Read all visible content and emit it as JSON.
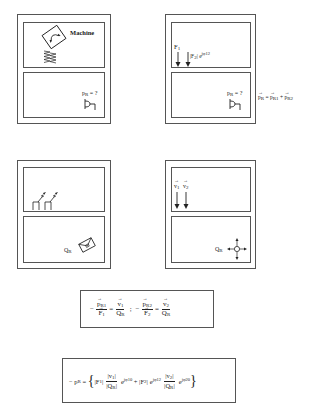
{
  "panels": [
    {
      "id": "machine",
      "top_label": "Machine",
      "bottom_label": "p",
      "bottom_label_sub": "R",
      "bottom_label_suffix": " = ?"
    },
    {
      "id": "forces",
      "force1_label": "F",
      "force1_sub": "1",
      "force2_label": "|F",
      "force2_sub": "2",
      "force2_suffix": "| e",
      "force2_exp": "jφ12",
      "bottom_label": "p",
      "bottom_label_sub": "R",
      "bottom_label_suffix": " = ?"
    },
    {
      "id": "velocity-source",
      "bottom_label": "Q",
      "bottom_label_sub": "R"
    },
    {
      "id": "velocities",
      "v1_label": "v",
      "v1_sub": "1",
      "v2_label": "v",
      "v2_sub": "2",
      "bottom_label": "Q",
      "bottom_label_sub": "R"
    }
  ],
  "side_equation": {
    "lhs": "p",
    "lhs_sub": "R",
    "eq": " = ",
    "t1": "p",
    "t1_sub": "R1",
    "plus": " + ",
    "t2": "p",
    "t2_sub": "R2"
  },
  "equation1": {
    "minus1": "−",
    "num1": "p",
    "num1_sub": "R1",
    "den1": "F",
    "den1_sub": "1",
    "eq1": "=",
    "num2": "v",
    "num2_sub": "1",
    "den2": "Q",
    "den2_sub": "R",
    "sep": ";",
    "minus2": "−",
    "num3": "p",
    "num3_sub": "R2",
    "den3": "F",
    "den3_sub": "2",
    "eq2": "=",
    "num4": "v",
    "num4_sub": "2",
    "den4": "Q",
    "den4_sub": "R"
  },
  "equation2": {
    "lhs": "− p",
    "lhs_sub": "R",
    "eq": " = ",
    "open": "{",
    "f1": "|F",
    "f1_sub": "1",
    "f1_close": "|",
    "v1_num": "|v",
    "v1_num_sub": "1",
    "v1_num_close": "|",
    "q1_den": "|Q",
    "q1_den_sub": "R",
    "q1_den_close": "|",
    "e1": "e",
    "e1_exp": "jφ10",
    "plus": " + ",
    "f2": "|F",
    "f2_sub": "2",
    "f2_close": "|",
    "e2": "e",
    "e2_exp": "jφ12",
    "v2_num": "|v",
    "v2_num_sub": "2",
    "v2_num_close": "|",
    "q2_den": "|Q",
    "q2_den_sub": "R",
    "q2_den_close": "|",
    "e3": "e",
    "e3_exp": "jφ20",
    "close": "}"
  },
  "colors": {
    "line": "#555555",
    "ink": "#222222",
    "background": "#ffffff"
  }
}
